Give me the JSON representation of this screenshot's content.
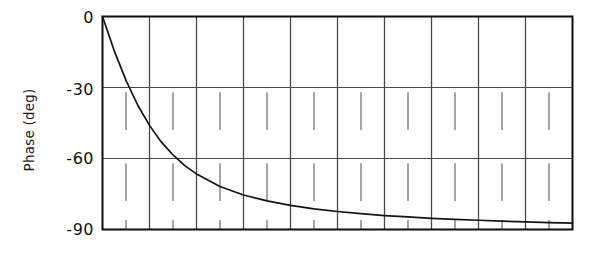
{
  "chart_data": {
    "type": "line",
    "title": "",
    "xlabel": "",
    "ylabel": "Phase (deg)",
    "ylim": [
      -90,
      0
    ],
    "yticks": [
      0,
      -30,
      -60,
      -90
    ],
    "ytick_labels": [
      "0",
      "-30",
      "-60",
      "-90"
    ],
    "xlim": [
      0,
      10
    ],
    "xticks": [
      0,
      1,
      2,
      3,
      4,
      5,
      6,
      7,
      8,
      9,
      10
    ],
    "xtick_labels": [
      "",
      "",
      "",
      "",
      "",
      "",
      "",
      "",
      "",
      "",
      ""
    ],
    "grid": "major vertical gridlines at every x division; horizontal gridlines at -30 and -60; minor vertical ticks offset between majors in lower half",
    "legend": "none",
    "series": [
      {
        "name": "Phase",
        "description": "First-order lag phase response decaying from 0 deg asymptotically toward -90 deg",
        "x": [
          0.0,
          0.25,
          0.5,
          0.75,
          1.0,
          1.25,
          1.5,
          1.75,
          2.0,
          2.5,
          3.0,
          3.5,
          4.0,
          4.5,
          5.0,
          5.5,
          6.0,
          6.5,
          7.0,
          7.5,
          8.0,
          8.5,
          9.0,
          9.5,
          10.0
        ],
        "y": [
          0.0,
          -14.5,
          -27.0,
          -37.5,
          -46.0,
          -53.0,
          -58.5,
          -63.0,
          -66.5,
          -71.8,
          -75.4,
          -77.9,
          -79.8,
          -81.3,
          -82.4,
          -83.3,
          -84.1,
          -84.7,
          -85.3,
          -85.7,
          -86.1,
          -86.5,
          -86.8,
          -87.1,
          -87.3
        ]
      }
    ],
    "curve_color": "#141414",
    "grid_color": "#4a4a4a",
    "axis_color": "#0d0d0d"
  },
  "axes": {
    "ylabel_text": "Phase (deg)",
    "ytick_0": "0",
    "ytick_30": "-30",
    "ytick_60": "-60",
    "ytick_90": "-90"
  }
}
